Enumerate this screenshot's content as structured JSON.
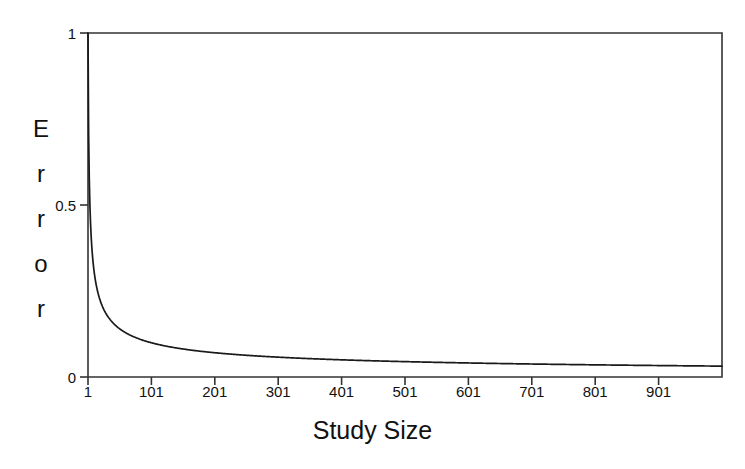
{
  "chart_data": {
    "type": "line",
    "title": "",
    "subtitle": "",
    "xlabel": "Study Size",
    "ylabel": "Error",
    "ylabel_letters": [
      "E",
      "r",
      "r",
      "o",
      "r"
    ],
    "xlim": [
      1,
      1001
    ],
    "ylim": [
      0,
      1
    ],
    "grid": false,
    "legend": null,
    "legend_position": "none",
    "line_color": "#1a1a1a",
    "axis_color": "#333333",
    "background_color": "#ffffff",
    "xticks": [
      1,
      101,
      201,
      301,
      401,
      501,
      601,
      701,
      801,
      901
    ],
    "xtick_labels": [
      "1",
      "101",
      "201",
      "301",
      "401",
      "501",
      "601",
      "701",
      "801",
      "901"
    ],
    "yticks": [
      0,
      0.5,
      1
    ],
    "ytick_labels": [
      "0",
      "0.5",
      "1"
    ],
    "series": [
      {
        "name": "Error",
        "formula": "1/sqrt(n)",
        "x": [
          1,
          2,
          3,
          4,
          5,
          6,
          8,
          10,
          13,
          16,
          20,
          25,
          31,
          38,
          46,
          56,
          68,
          82,
          101,
          121,
          145,
          171,
          201,
          235,
          271,
          311,
          351,
          401,
          451,
          501,
          551,
          601,
          651,
          701,
          751,
          801,
          851,
          901,
          951,
          1001
        ],
        "values": [
          1.0,
          0.707,
          0.577,
          0.5,
          0.447,
          0.408,
          0.354,
          0.316,
          0.277,
          0.25,
          0.224,
          0.2,
          0.18,
          0.162,
          0.147,
          0.134,
          0.121,
          0.11,
          0.0995,
          0.0909,
          0.083,
          0.0765,
          0.0705,
          0.0652,
          0.0607,
          0.0567,
          0.0534,
          0.0499,
          0.0471,
          0.0447,
          0.0426,
          0.0408,
          0.0392,
          0.0378,
          0.0365,
          0.0353,
          0.0343,
          0.0333,
          0.0324,
          0.0316
        ]
      }
    ],
    "annotations": []
  },
  "plot_geometry": {
    "left_px": 88,
    "right_px": 722,
    "top_px": 33,
    "bottom_px": 377
  }
}
